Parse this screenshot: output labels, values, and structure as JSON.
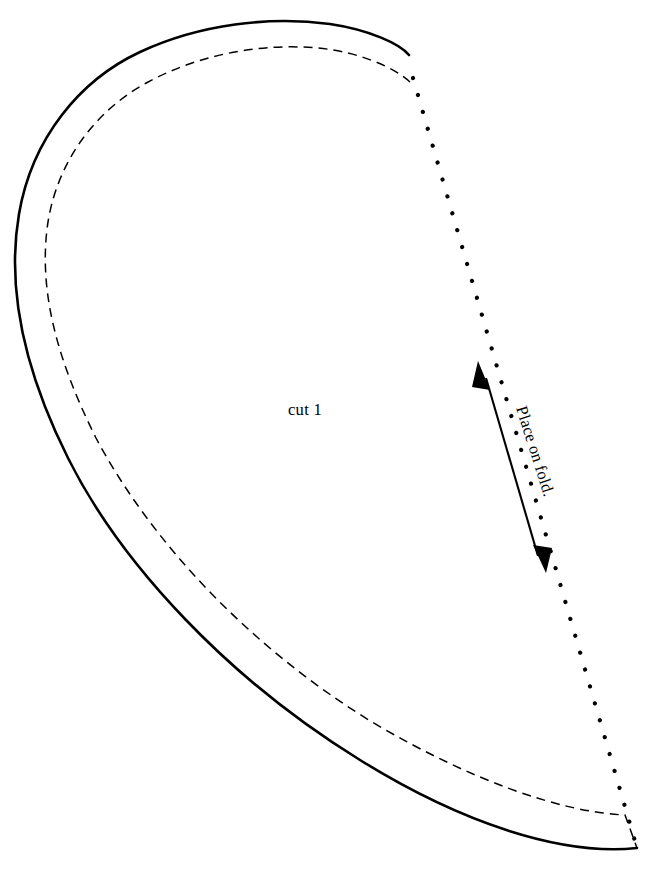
{
  "document": {
    "type": "sewing-pattern-piece",
    "shape": "half-heart",
    "background_color": "#ffffff",
    "ink_color": "#000000",
    "width": 648,
    "height": 870
  },
  "labels": {
    "cut_instruction": "cut 1",
    "fold_instruction": "Place on fold."
  },
  "lines": {
    "cutting_line": {
      "name": "cutting-line",
      "style": "solid",
      "stroke_width": 2.6,
      "color": "#000000",
      "path": "M 409 55 C 400 44 370 30 330 24 C 270 16 200 24 140 52 C 80 80 32 138 19 214 C 6 290 24 370 68 458 C 122 566 230 680 360 760 C 460 822 560 856 637 848"
    },
    "seam_allowance_line": {
      "name": "seam-allowance-line",
      "style": "dashed",
      "stroke_width": 1.5,
      "dash": "9 6",
      "color": "#000000",
      "path": "M 410 82 C 395 68 360 52 318 48 C 262 43 200 54 148 82 C 96 110 58 160 48 222 C 38 288 56 358 96 438 C 150 540 248 646 372 722 C 470 780 560 812 625 815 L 637 848"
    },
    "fold_line": {
      "name": "fold-line",
      "style": "dotted",
      "stroke_width": 4.2,
      "color": "#000000",
      "path": "M 413 78 L 637 848"
    }
  },
  "grainline": {
    "name": "grainline-arrow",
    "style": "double-headed",
    "color": "#000000",
    "start": {
      "x": 479,
      "y": 363
    },
    "end": {
      "x": 545,
      "y": 571
    },
    "angle_deg": 72.4,
    "head_start": "arrow-head-up",
    "head_end": "arrow-head-down"
  },
  "text_placement": {
    "cut_instruction": {
      "x": 305,
      "y": 415,
      "rotation_deg": 0,
      "anchor": "middle"
    },
    "fold_instruction": {
      "x": 516,
      "y": 408,
      "rotation_deg": 72.4,
      "anchor": "start"
    }
  }
}
